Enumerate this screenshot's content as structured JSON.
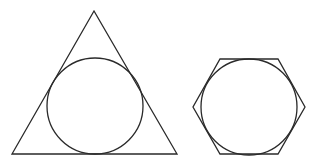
{
  "canvas": {
    "width": 316,
    "height": 168,
    "background": "#ffffff"
  },
  "stroke": {
    "color": "#2a2a2a",
    "width": 1.3
  },
  "shapes": {
    "triangle": {
      "label": "triangle with inscribed circle",
      "points": "94,11 12,154 177,154",
      "incircle": {
        "cx": 95,
        "cy": 106,
        "r": 48
      }
    },
    "hexagon": {
      "label": "hexagon with inscribed circle",
      "points": "220,59 278,59 305,107 278,154 220,154 193,107",
      "incircle": {
        "cx": 249,
        "cy": 107,
        "r": 48
      }
    }
  }
}
